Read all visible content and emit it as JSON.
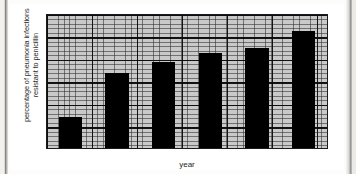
{
  "chart_data": {
    "type": "bar",
    "title": "",
    "xlabel": "year",
    "ylabel": "percentage of pneumonia infections\nresistant to penicillin",
    "categories": [
      "1992",
      "1993",
      "1994",
      "1995",
      "1996",
      "1997"
    ],
    "values": [
      7,
      17,
      19.5,
      21.5,
      22.5,
      26.5
    ],
    "ylim": [
      0,
      30
    ],
    "yticks": [
      0,
      5,
      10,
      15,
      20,
      25,
      30
    ],
    "ytick_labels": [
      "0",
      "5",
      "10",
      "15",
      "20",
      "25",
      "30"
    ],
    "grid": true,
    "minor_grid": true,
    "legend": null,
    "bar_color": "#000000",
    "plot_background": "#c9c9c9",
    "axis_color": "#1a1a1a"
  }
}
